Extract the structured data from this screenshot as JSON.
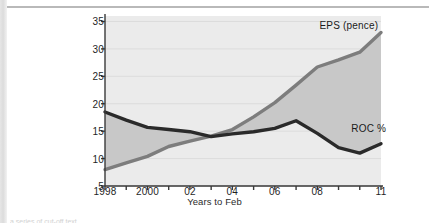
{
  "page": {
    "bottom_cut_text": "a series of cut-off text"
  },
  "chart_data": {
    "type": "line",
    "title": "",
    "xlabel": "Years to Feb",
    "ylabel": "",
    "grid": true,
    "legend": "inline-annotation",
    "fill_between": true,
    "ylim": [
      5,
      36
    ],
    "xlim": [
      1998,
      2011
    ],
    "yticks": [
      5,
      10,
      15,
      20,
      25,
      30,
      35
    ],
    "ytick_labels": [
      "5",
      "10",
      "15",
      "20",
      "25",
      "30",
      "35"
    ],
    "xticks": [
      1998,
      1999,
      2000,
      2001,
      2002,
      2003,
      2004,
      2005,
      2006,
      2007,
      2008,
      2009,
      2010,
      2011
    ],
    "xtick_labels": [
      "1998",
      "",
      "2000",
      "",
      "02",
      "",
      "04",
      "",
      "06",
      "",
      "08",
      "",
      "",
      "11"
    ],
    "x": [
      1998,
      1999,
      2000,
      2001,
      2002,
      2003,
      2004,
      2005,
      2006,
      2007,
      2008,
      2009,
      2010,
      2011
    ],
    "series": [
      {
        "name": "EPS (pence)",
        "color": "#7d7d7d",
        "values": [
          8.0,
          9.2,
          10.4,
          12.2,
          13.2,
          14.1,
          15.3,
          17.6,
          20.2,
          23.4,
          26.7,
          28.0,
          29.4,
          33.0
        ]
      },
      {
        "name": "ROC %",
        "color": "#2a2a2a",
        "values": [
          18.5,
          17.0,
          15.7,
          15.3,
          14.9,
          14.0,
          14.5,
          14.9,
          15.5,
          16.9,
          14.6,
          12.0,
          11.0,
          12.7
        ]
      }
    ],
    "annotations": [
      {
        "text": "EPS (pence)",
        "x": 2008.1,
        "y": 34.2
      },
      {
        "text": "ROC %",
        "x": 2009.6,
        "y": 15.4
      }
    ],
    "colors": {
      "plot_background": "#ebebeb",
      "fill_between": "#c8c8c8",
      "gridline": "#dcdcdc",
      "axis": "#3a3a3a",
      "text": "#1f1f1f",
      "eps_line": "#7d7d7d",
      "roc_line": "#2a2a2a"
    }
  }
}
